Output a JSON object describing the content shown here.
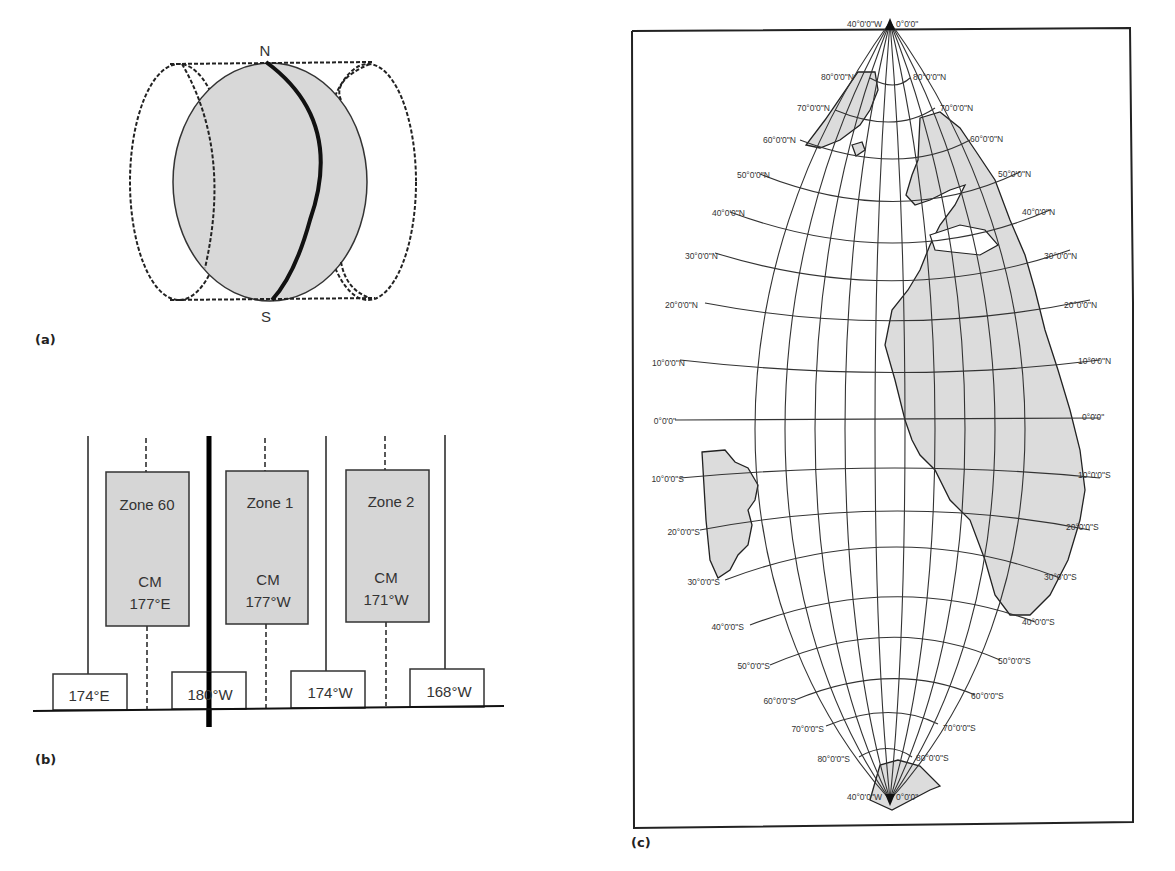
{
  "panels": {
    "a": {
      "label": "(a)",
      "north_label": "N",
      "south_label": "S",
      "colors": {
        "globe_fill": "#d8d8d8",
        "stroke": "#222222"
      }
    },
    "b": {
      "label": "(b)",
      "zones": [
        {
          "name": "Zone 60",
          "cm_label": "CM",
          "cm_value": "177°E"
        },
        {
          "name": "Zone 1",
          "cm_label": "CM",
          "cm_value": "177°W"
        },
        {
          "name": "Zone 2",
          "cm_label": "CM",
          "cm_value": "171°W"
        }
      ],
      "boundaries": [
        "174°E",
        "180°W",
        "174°W",
        "168°W"
      ],
      "colors": {
        "zone_fill": "#d6d6d6"
      }
    },
    "c": {
      "label": "(c)",
      "pole_north": {
        "left": "40°0'0\"W",
        "right": "0°0'0\""
      },
      "pole_south": {
        "left": "40°0'0\"W",
        "right": "0°0'0\""
      },
      "lat_labels_left": [
        "80°0'0\"N",
        "70°0'0\"N",
        "60°0'0\"N",
        "50°0'0\"N",
        "40°0'0\"N",
        "30°0'0\"N",
        "20°0'0\"N",
        "10°0'0\"N",
        "0°0'0\"",
        "10°0'0\"S",
        "20°0'0\"S",
        "30°0'0\"S",
        "40°0'0\"S",
        "50°0'0\"S",
        "60°0'0\"S",
        "70°0'0\"S",
        "80°0'0\"S"
      ],
      "lat_labels_right": [
        "80°0'0\"N",
        "70°0'0\"N",
        "60°0'0\"N",
        "50°0'0\"N",
        "40°0'0\"N",
        "30°0'0\"N",
        "20°0'0\"N",
        "10°0'0\"N",
        "0°0'0\"",
        "10°0'0\"S",
        "20°0'0\"S",
        "30°0'0\"S",
        "40°0'0\"S",
        "50°0'0\"S",
        "60°0'0\"S",
        "70°0'0\"S",
        "80°0'0\"S"
      ],
      "colors": {
        "land_fill": "#dcdcdc",
        "grid": "#333333"
      }
    }
  }
}
